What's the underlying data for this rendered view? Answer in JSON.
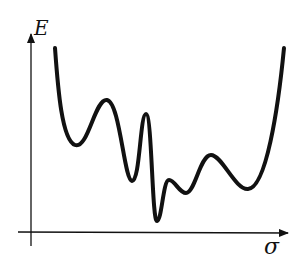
{
  "diagram": {
    "title": "",
    "y_axis_label": "E",
    "x_axis_label": "σ",
    "curve_description": "Rugged energy landscape: multiple local minima with a deep global minimum near the center",
    "stroke_color": "#111111",
    "background": "#ffffff"
  }
}
